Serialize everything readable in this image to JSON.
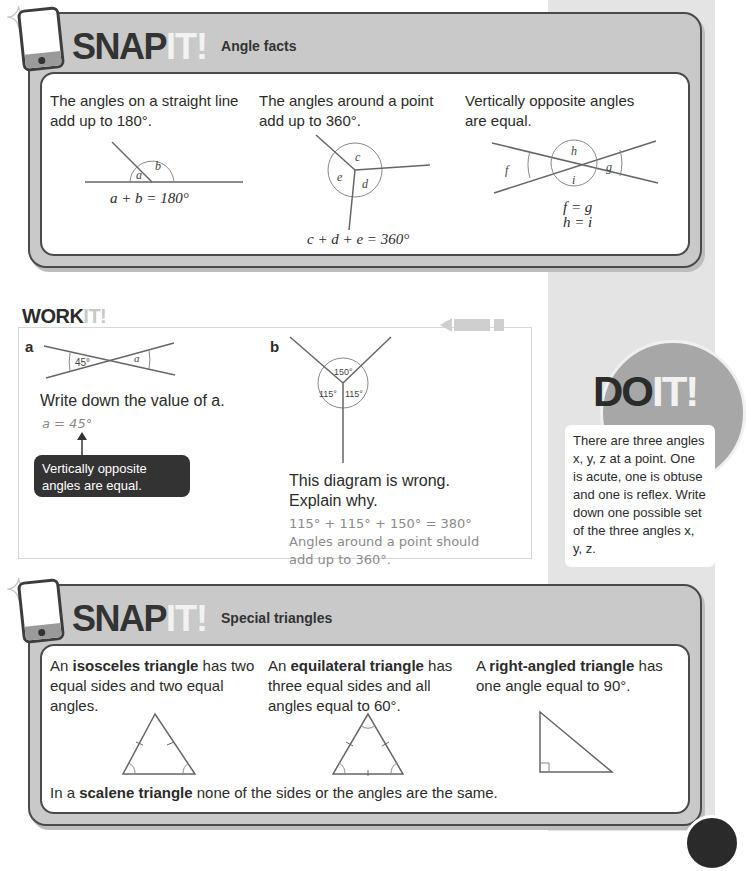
{
  "snap1": {
    "brand_snap": "SNAP",
    "brand_it": "IT!",
    "subtitle": "Angle facts",
    "columns": [
      {
        "text": "The angles on a straight line add up to 180°.",
        "labels": [
          "a",
          "b"
        ],
        "equation": "a + b = 180°"
      },
      {
        "text": "The angles around a point add up to 360°.",
        "labels": [
          "c",
          "d",
          "e"
        ],
        "equation": "c + d + e = 360°"
      },
      {
        "text": "Vertically opposite angles are equal.",
        "labels": [
          "h",
          "f",
          "g",
          "i"
        ],
        "equation_1": "f = g",
        "equation_2": "h = i"
      }
    ]
  },
  "workit": {
    "title_work": "WORK",
    "title_it": "IT!",
    "q_a": {
      "label": "a",
      "angle_known": "45°",
      "angle_unknown": "a",
      "question": "Write down the value of a.",
      "answer": "a = 45°",
      "callout": "Vertically opposite angles are equal."
    },
    "q_b": {
      "label": "b",
      "angles": [
        "150°",
        "115°",
        "115°"
      ],
      "question_1": "This diagram is wrong.",
      "question_2": "Explain why.",
      "answer_1": "115° + 115° + 150° = 380°",
      "answer_2": "Angles around a point should",
      "answer_3": "add up to 360°."
    }
  },
  "doit": {
    "title_do": "DO",
    "title_it": "IT!",
    "body": "There are three angles x, y, z at a point. One is acute, one is obtuse and one is reflex. Write down one possible set of the three angles x, y, z."
  },
  "snap2": {
    "brand_snap": "SNAP",
    "brand_it": "IT!",
    "subtitle": "Special triangles",
    "col1": {
      "pre": "An ",
      "bold": "isosceles triangle",
      "post": " has two equal sides and two equal angles."
    },
    "col2": {
      "pre": "An ",
      "bold": "equilateral triangle",
      "post": " has three equal sides and all angles equal to 60°."
    },
    "col3": {
      "pre": "A ",
      "bold": "right-angled triangle",
      "post": " has one angle equal to 90°."
    },
    "footer": {
      "pre": "In a ",
      "bold": "scalene triangle",
      "post": " none of the sides or the angles are the same."
    }
  }
}
